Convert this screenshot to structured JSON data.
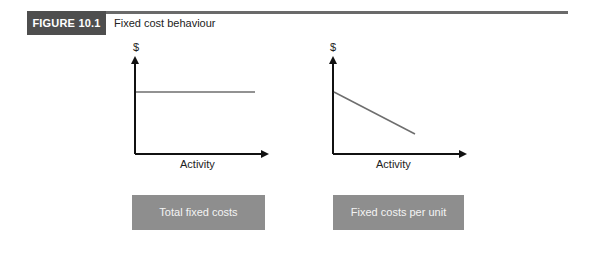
{
  "figure": {
    "label": "FIGURE 10.1",
    "title": "Fixed cost behaviour"
  },
  "charts": [
    {
      "y_label": "$",
      "x_label": "Activity",
      "caption": "Total fixed costs",
      "line": "horizontal"
    },
    {
      "y_label": "$",
      "x_label": "Activity",
      "caption": "Fixed costs per unit",
      "line": "decreasing"
    }
  ],
  "colors": {
    "figure_label_bg": "#4e4e4e",
    "top_rule": "#6a6a6a",
    "caption_box_bg": "#8e8e8e",
    "axis": "#111111",
    "plot_line": "#6e6e6e"
  }
}
